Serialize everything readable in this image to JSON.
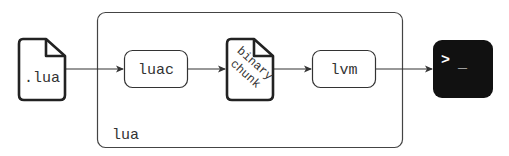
{
  "diagram": {
    "container": {
      "label": "lua"
    },
    "nodes": [
      {
        "id": "source",
        "kind": "file",
        "label": ".lua"
      },
      {
        "id": "luac",
        "kind": "process",
        "label": "luac"
      },
      {
        "id": "chunk",
        "kind": "file",
        "label_line1": "binary",
        "label_line2": "chunk"
      },
      {
        "id": "lvm",
        "kind": "process",
        "label": "lvm"
      },
      {
        "id": "terminal",
        "kind": "terminal",
        "prompt": ">",
        "cursor": "_"
      }
    ],
    "edges": [
      {
        "from": "source",
        "to": "luac"
      },
      {
        "from": "luac",
        "to": "chunk"
      },
      {
        "from": "chunk",
        "to": "lvm"
      },
      {
        "from": "lvm",
        "to": "terminal"
      }
    ],
    "colors": {
      "stroke": "#333333",
      "terminal_bg": "#111111",
      "terminal_fg": "#ffffff"
    }
  }
}
